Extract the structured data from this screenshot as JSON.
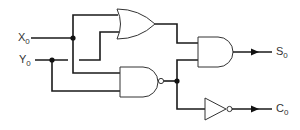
{
  "diagram": {
    "type": "logic-circuit",
    "inputs": [
      {
        "name": "X",
        "subscript": "0"
      },
      {
        "name": "Y",
        "subscript": "0"
      }
    ],
    "outputs": [
      {
        "name": "S",
        "subscript": "0"
      },
      {
        "name": "C",
        "subscript": "0"
      }
    ],
    "gates": [
      {
        "id": "or1",
        "type": "OR",
        "inputs": [
          "X0",
          "Y0"
        ],
        "output": "and1.in1"
      },
      {
        "id": "nand1",
        "type": "NAND",
        "inputs": [
          "X0",
          "Y0"
        ],
        "output": "junction"
      },
      {
        "id": "and1",
        "type": "AND",
        "inputs": [
          "or1",
          "nand1"
        ],
        "output": "S0"
      },
      {
        "id": "not1",
        "type": "NOT",
        "inputs": [
          "nand1"
        ],
        "output": "C0"
      }
    ],
    "colors": {
      "wire": "#1a1a1a",
      "gate_outline": "#333333",
      "background": "#ffffff"
    }
  }
}
